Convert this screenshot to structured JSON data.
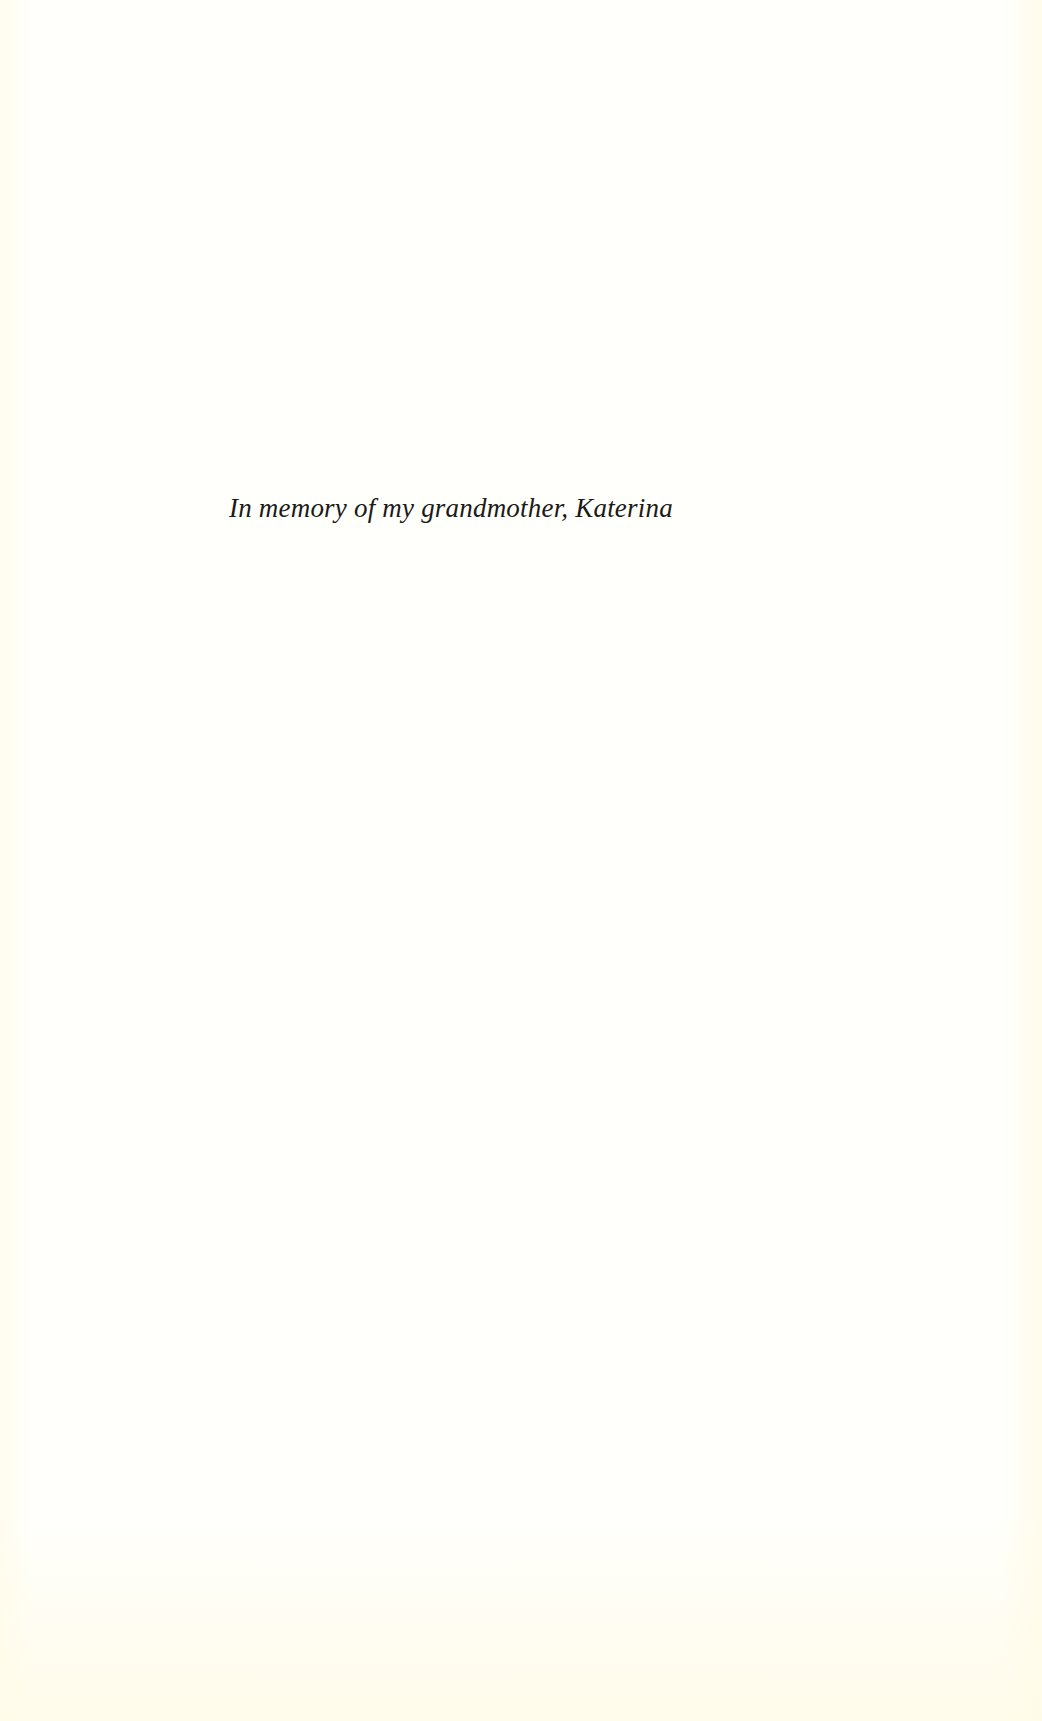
{
  "page": {
    "type": "dedication",
    "background_color": "#fffffc",
    "edge_tint_color": "#fffbea",
    "text_color": "#1c1a17"
  },
  "dedication": {
    "text": "In memory of my grandmother, Katerina"
  }
}
